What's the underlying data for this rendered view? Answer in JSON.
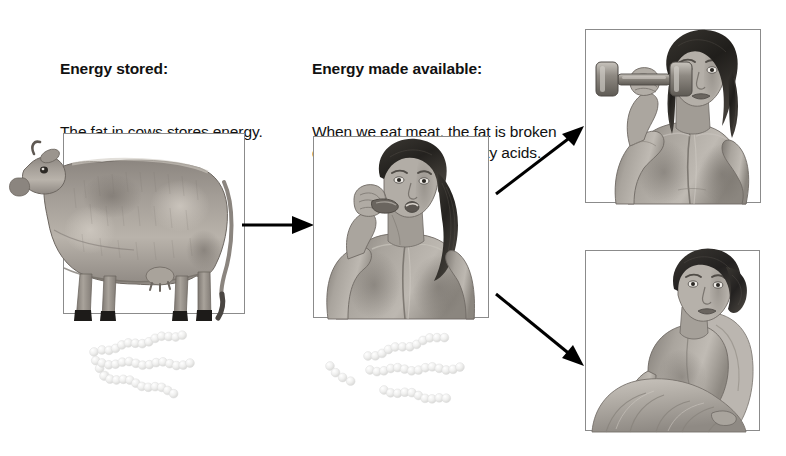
{
  "figure": {
    "background_color": "#ffffff",
    "width": 786,
    "height": 456
  },
  "captions": {
    "stored": {
      "lead": "Energy stored:",
      "body": "The fat in cows stores energy."
    },
    "available": {
      "lead": "Energy made available:",
      "body": "When we eat meat, the fat is broken down into glycerol and fatty acids."
    }
  },
  "panels": [
    {
      "id": "cow",
      "name": "cow-illustration",
      "subject": "cow standing in profile",
      "border_color": "#8b8b8b"
    },
    {
      "id": "eating",
      "name": "woman-eating-illustration",
      "subject": "woman eating meat",
      "border_color": "#8b8b8b"
    },
    {
      "id": "exercise",
      "name": "woman-lifting-dumbbell-illustration",
      "subject": "woman lifting a dumbbell",
      "border_color": "#8b8b8b"
    },
    {
      "id": "resting",
      "name": "woman-resting-illustration",
      "subject": "woman reclining at rest",
      "border_color": "#8b8b8b"
    }
  ],
  "molecules": {
    "triglyceride": {
      "label": "triglyceride",
      "chain_count": 3,
      "intact": true,
      "color": "#e9e9e9"
    },
    "broken": {
      "label": "glycerol and fatty acids",
      "glycerol_count": 1,
      "fatty_acid_count": 3,
      "intact": false,
      "color": "#e9e9e9"
    }
  },
  "arrows": [
    {
      "id": "cow-to-person",
      "direction": "right",
      "color": "#000000"
    },
    {
      "id": "to-exercise",
      "direction": "up-right",
      "color": "#000000"
    },
    {
      "id": "to-resting",
      "direction": "down-right",
      "color": "#000000"
    }
  ]
}
